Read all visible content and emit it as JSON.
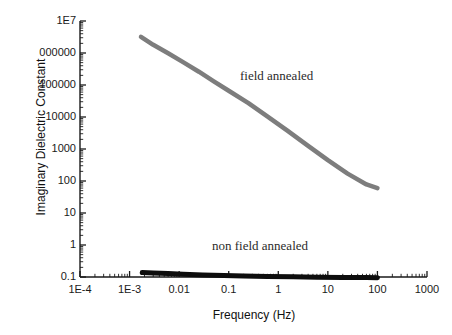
{
  "chart_data": {
    "type": "line",
    "title": "",
    "xlabel": "Frequency (Hz)",
    "ylabel": "Imaginary Dielectric Constant",
    "xscale": "log",
    "yscale": "log",
    "xlim": [
      0.0001,
      1000
    ],
    "ylim": [
      0.1,
      10000000
    ],
    "grid": false,
    "legend_position": "inline-annotations",
    "xticks": [
      {
        "value": 0.0001,
        "label": "1E-4"
      },
      {
        "value": 0.001,
        "label": "1E-3"
      },
      {
        "value": 0.01,
        "label": "0.01"
      },
      {
        "value": 0.1,
        "label": "0.1"
      },
      {
        "value": 1,
        "label": "1"
      },
      {
        "value": 10,
        "label": "10"
      },
      {
        "value": 100,
        "label": "100"
      },
      {
        "value": 1000,
        "label": "1000"
      }
    ],
    "yticks": [
      {
        "value": 10000000,
        "label": "1E7"
      },
      {
        "value": 1000000,
        "label": "000000"
      },
      {
        "value": 100000,
        "label": "100000"
      },
      {
        "value": 10000,
        "label": "10000"
      },
      {
        "value": 1000,
        "label": "1000"
      },
      {
        "value": 100,
        "label": "100"
      },
      {
        "value": 10,
        "label": "10"
      },
      {
        "value": 1,
        "label": "1"
      },
      {
        "value": 0.1,
        "label": "0.1"
      }
    ],
    "series": [
      {
        "name": "field annealed",
        "color": "#7d7d7d",
        "linewidth": 4.5,
        "annotation": "field annealed",
        "x": [
          0.0017,
          0.003,
          0.006,
          0.012,
          0.025,
          0.05,
          0.1,
          0.25,
          0.6,
          1.5,
          4,
          10,
          25,
          60,
          100
        ],
        "y": [
          3200000,
          1800000,
          980000,
          520000,
          260000,
          130000,
          66000,
          27000,
          10500,
          3800,
          1250,
          450,
          170,
          78,
          60
        ]
      },
      {
        "name": "non field annealed",
        "color": "#0d0d0d",
        "linewidth": 5,
        "annotation": "non field annealed",
        "x": [
          0.0018,
          0.003,
          0.006,
          0.012,
          0.03,
          0.08,
          0.2,
          0.6,
          2,
          6,
          20,
          60,
          100
        ],
        "y": [
          0.137,
          0.133,
          0.128,
          0.122,
          0.116,
          0.111,
          0.107,
          0.104,
          0.101,
          0.099,
          0.097,
          0.096,
          0.095
        ]
      }
    ]
  },
  "axes": {
    "x_title": "Frequency (Hz)",
    "y_title": "Imaginary Dielectric Constant"
  },
  "annotations": {
    "field_annealed": "field annealed",
    "non_field_annealed": "non field annealed"
  },
  "colors": {
    "field_annealed": "#7d7d7d",
    "non_field_annealed": "#0d0d0d",
    "axis": "#1a1a1a",
    "background": "#ffffff"
  }
}
